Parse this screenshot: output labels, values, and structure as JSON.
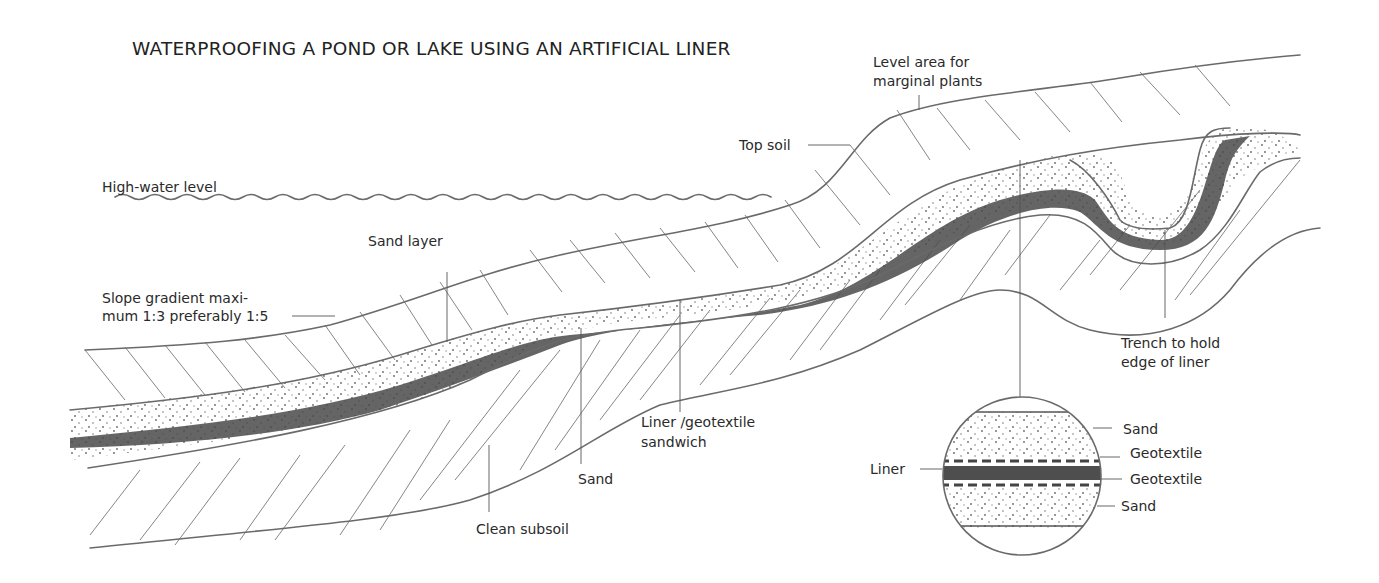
{
  "diagram": {
    "title": "WATERPROOFING A POND OR LAKE USING AN ARTIFICIAL LINER",
    "labels": {
      "high_water_level": "High-water level",
      "level_area_line1": "Level area for",
      "level_area_line2": "marginal plants",
      "top_soil": "Top soil",
      "sand_layer": "Sand layer",
      "slope_line1": "Slope gradient maxi-",
      "slope_line2": "mum 1:3 preferably 1:5",
      "trench_line1": "Trench to hold",
      "trench_line2": "edge of liner",
      "liner_sandwich_line1": "Liner /geotextile",
      "liner_sandwich_line2": "sandwich",
      "sand": "Sand",
      "clean_subsoil": "Clean subsoil"
    },
    "inset": {
      "liner": "Liner",
      "sand_top": "Sand",
      "geotextile_top": "Geotextile",
      "geotextile_bottom": "Geotextile",
      "sand_bottom": "Sand"
    },
    "layers": [
      "Top soil",
      "Sand",
      "Liner / geotextile sandwich",
      "Sand",
      "Clean subsoil"
    ],
    "colors": {
      "outline": "#6a6a6a",
      "liner": "#4a4a4a",
      "text": "#2a2a2a",
      "background": "#ffffff"
    }
  }
}
